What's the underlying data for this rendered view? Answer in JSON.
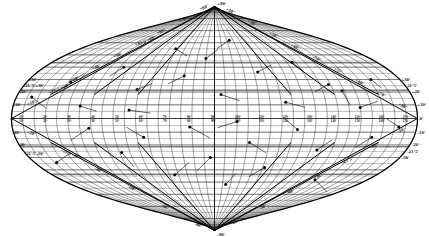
{
  "chart_data": {
    "type": "scatter",
    "title": "",
    "subtitle": "",
    "projection": "pointed-oval (lens / sinusoidal-like) graticule",
    "xlabel": "",
    "ylabel": "",
    "grid": true,
    "legend": "none",
    "xlim": [
      -180,
      180
    ],
    "ylim": [
      -90,
      90
    ],
    "axis_notes": "Latitude parallels drawn every 10 degrees with additional tropic-like lines at +/-21 deg 5'; meridians drawn every 10 degrees of longitude.",
    "pole_labels": {
      "north": "+90°",
      "south": "-90°"
    },
    "left_latitude_ticks": [
      "+30°",
      "+21°5'+30°",
      "+20°",
      "+10°",
      "0°",
      "-10°",
      "-20°",
      "-21°5'-30°"
    ],
    "right_latitude_ticks": [
      "+30°",
      "21°5'",
      "+20°",
      "+10°",
      "0°",
      "-10°",
      "-20°",
      "-21°5'",
      "-30°"
    ],
    "upper_left_diagonal_ticks": [
      "+10°",
      "+21°5'+30°",
      "+20°",
      "+40°",
      "+50°",
      "+43°5'+60°",
      "+60°",
      "+70°",
      "+80°"
    ],
    "upper_right_diagonal_ticks": [
      "+80°",
      "+70°",
      "+60°",
      "+55°",
      "+50°",
      "+40°",
      "+30°",
      "+20°",
      "+10°"
    ],
    "lower_left_diagonal_ticks": [
      "-20°",
      "-21°5'-30°",
      "-40°",
      "-50°",
      "-60°",
      "-80°"
    ],
    "lower_right_diagonal_ticks": [
      "-10°",
      "-20°",
      "-21°5'",
      "-30°",
      "-40°",
      "-50°",
      "-60°"
    ],
    "equator_tick_labels": [
      "10°",
      "20°",
      "30°",
      "40°",
      "50°",
      "60°",
      "70°",
      "80°",
      "90°",
      "100°",
      "110°",
      "120°",
      "130°",
      "140°",
      "150°",
      "160°",
      "170°"
    ],
    "meridian_step_deg": 10,
    "parallel_step_deg": 10,
    "series": [
      {
        "name": "plotted points with direction vectors",
        "marker": "filled dot with straight tail",
        "count": 34,
        "points": [
          {
            "lon": -138,
            "lat": 28,
            "dx": 13,
            "dy": -8
          },
          {
            "lon": -120,
            "lat": 9,
            "dx": 16,
            "dy": 5
          },
          {
            "lon": -112,
            "lat": -7,
            "dx": -18,
            "dy": 12
          },
          {
            "lon": -96,
            "lat": 40,
            "dx": -14,
            "dy": 9
          },
          {
            "lon": -88,
            "lat": -26,
            "dx": 12,
            "dy": 14
          },
          {
            "lon": -72,
            "lat": 22,
            "dx": 15,
            "dy": -6
          },
          {
            "lon": -64,
            "lat": -14,
            "dx": -17,
            "dy": -10
          },
          {
            "lon": -52,
            "lat": 55,
            "dx": 11,
            "dy": 7
          },
          {
            "lon": -44,
            "lat": -44,
            "dx": 14,
            "dy": -12
          },
          {
            "lon": -30,
            "lat": 33,
            "dx": -16,
            "dy": 8
          },
          {
            "lon": -22,
            "lat": -6,
            "dx": 20,
            "dy": 11
          },
          {
            "lon": -10,
            "lat": 47,
            "dx": 12,
            "dy": -9
          },
          {
            "lon": -4,
            "lat": -30,
            "dx": -13,
            "dy": 13
          },
          {
            "lon": 6,
            "lat": 18,
            "dx": 18,
            "dy": 6
          },
          {
            "lon": 14,
            "lat": -52,
            "dx": 10,
            "dy": -11
          },
          {
            "lon": 24,
            "lat": 62,
            "dx": -12,
            "dy": 8
          },
          {
            "lon": 32,
            "lat": -18,
            "dx": 16,
            "dy": 10
          },
          {
            "lon": 44,
            "lat": 36,
            "dx": 13,
            "dy": -7
          },
          {
            "lon": 52,
            "lat": -38,
            "dx": -15,
            "dy": 9
          },
          {
            "lon": 64,
            "lat": 12,
            "dx": 19,
            "dy": 5
          },
          {
            "lon": 74,
            "lat": -8,
            "dx": -14,
            "dy": -12
          },
          {
            "lon": 86,
            "lat": 44,
            "dx": 11,
            "dy": 9
          },
          {
            "lon": 96,
            "lat": -24,
            "dx": 15,
            "dy": -10
          },
          {
            "lon": 108,
            "lat": 26,
            "dx": -13,
            "dy": 7
          },
          {
            "lon": 118,
            "lat": -48,
            "dx": 12,
            "dy": 12
          },
          {
            "lon": 130,
            "lat": 8,
            "dx": 17,
            "dy": -6
          },
          {
            "lon": 142,
            "lat": -14,
            "dx": -16,
            "dy": 10
          },
          {
            "lon": 152,
            "lat": 30,
            "dx": 10,
            "dy": 8
          },
          {
            "lon": -158,
            "lat": -34,
            "dx": 13,
            "dy": -9
          },
          {
            "lon": -166,
            "lat": 16,
            "dx": 14,
            "dy": 11
          },
          {
            "lon": 164,
            "lat": -6,
            "dx": -12,
            "dy": -8
          },
          {
            "lon": -76,
            "lat": 6,
            "dx": 21,
            "dy": 3
          },
          {
            "lon": 20,
            "lat": -2,
            "dx": -19,
            "dy": 6
          },
          {
            "lon": 118,
            "lat": 21,
            "dx": 8,
            "dy": 14
          }
        ]
      }
    ]
  },
  "figure": {
    "pole_north": "+90°",
    "pole_south": "-90°"
  }
}
